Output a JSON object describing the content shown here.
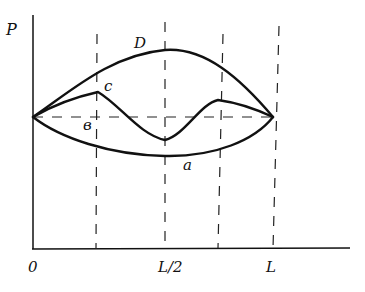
{
  "diagram": {
    "axis_labels": {
      "y": "P",
      "x_ticks": [
        "0",
        "L/2",
        "L"
      ]
    },
    "curve_labels": {
      "top": "D",
      "wavy": "c",
      "mid": "в",
      "bottom": "a"
    },
    "colors": {
      "ink": "#111111",
      "background": "#ffffff"
    }
  }
}
